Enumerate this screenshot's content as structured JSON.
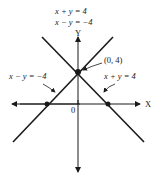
{
  "title_lines": [
    "x + y = 4",
    "x − y = −4"
  ],
  "axes": {
    "x_label": "X",
    "y_label": "Y",
    "origin_label": "0"
  },
  "lines": [
    {
      "equation": "x − y = −4",
      "label": "x − y = −4"
    },
    {
      "equation": "x + y = 4",
      "label": "x + y = 4"
    }
  ],
  "points": [
    {
      "label": "(0, 4)",
      "x": 0,
      "y": 4,
      "role": "intersection"
    },
    {
      "label": "",
      "x": -4,
      "y": 0,
      "role": "x-intercept"
    },
    {
      "label": "",
      "x": 4,
      "y": 0,
      "role": "x-intercept"
    }
  ],
  "colors": {
    "ink": "#1a1a1a",
    "background": "#ffffff"
  }
}
